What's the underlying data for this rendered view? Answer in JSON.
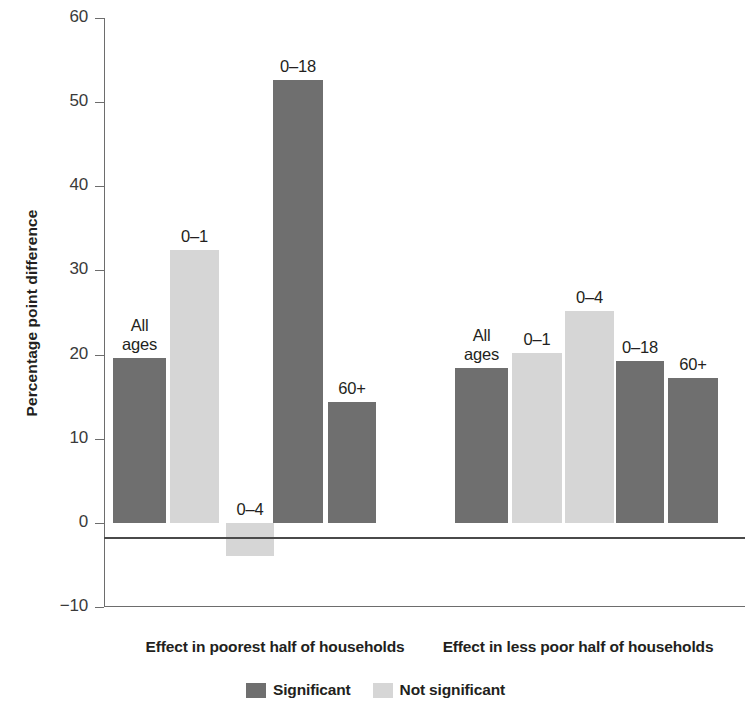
{
  "chart_data": {
    "type": "bar",
    "title": "",
    "xlabel": "",
    "ylabel": "Percentage point difference",
    "ylim": [
      -10,
      60
    ],
    "ytick_labels": [
      "60",
      "50",
      "40",
      "30",
      "20",
      "10",
      "0",
      "−10"
    ],
    "ytick_values": [
      60,
      50,
      40,
      30,
      20,
      10,
      0,
      -10
    ],
    "grid": false,
    "legend_position": "bottom-center",
    "legend": [
      {
        "name": "Significant",
        "color": "#6f6f6f"
      },
      {
        "name": "Not significant",
        "color": "#d6d6d6"
      }
    ],
    "groups": [
      {
        "caption": "Effect in poorest half of households",
        "bars": [
          {
            "label": "All\nages",
            "value": 19.6,
            "series": "Significant"
          },
          {
            "label": "0–1",
            "value": 32.4,
            "series": "Not significant"
          },
          {
            "label": "0–4",
            "value": -3.9,
            "series": "Not significant"
          },
          {
            "label": "0–18",
            "value": 52.6,
            "series": "Significant"
          },
          {
            "label": "60+",
            "value": 14.4,
            "series": "Significant"
          }
        ]
      },
      {
        "caption": "Effect in less poor half of households",
        "bars": [
          {
            "label": "All\nages",
            "value": 18.4,
            "series": "Significant"
          },
          {
            "label": "0–1",
            "value": 20.2,
            "series": "Not significant"
          },
          {
            "label": "0–4",
            "value": 25.2,
            "series": "Not significant"
          },
          {
            "label": "0–18",
            "value": 19.2,
            "series": "Significant"
          },
          {
            "label": "60+",
            "value": 17.2,
            "series": "Significant"
          }
        ]
      }
    ]
  },
  "colors": {
    "significant": "#6f6f6f",
    "not_significant": "#d6d6d6",
    "axis": "#6d6d6d",
    "text": "#231f20"
  }
}
